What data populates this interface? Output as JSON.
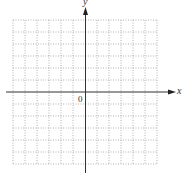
{
  "diagram": {
    "type": "coordinate-plane",
    "x_axis_label": "x",
    "y_axis_label": "y",
    "origin_label": "0",
    "grid": {
      "columns": 12,
      "rows": 12,
      "style": "dotted"
    },
    "colors": {
      "axis": "#333333",
      "grid": "#9a9a9a",
      "background": "#ffffff"
    }
  }
}
